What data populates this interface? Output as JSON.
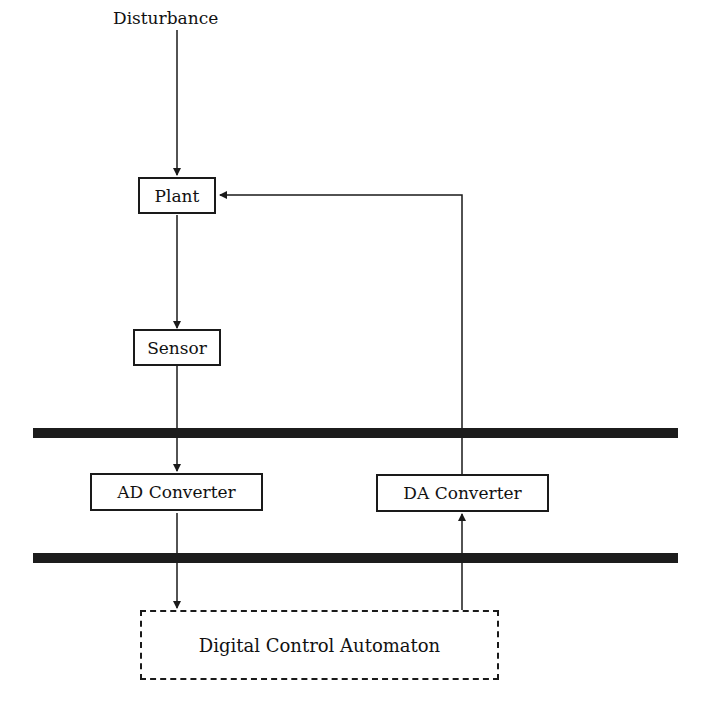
{
  "diagram": {
    "title": "",
    "nodes": {
      "disturbance": "Disturbance",
      "plant": "Plant",
      "sensor": "Sensor",
      "ad_converter": "AD Converter",
      "da_converter": "DA Converter",
      "automaton": "Digital Control Automaton"
    },
    "edges": [
      {
        "from": "Disturbance",
        "to": "Plant"
      },
      {
        "from": "Plant",
        "to": "Sensor"
      },
      {
        "from": "Sensor",
        "to": "AD Converter"
      },
      {
        "from": "AD Converter",
        "to": "Digital Control Automaton"
      },
      {
        "from": "Digital Control Automaton",
        "to": "DA Converter"
      },
      {
        "from": "DA Converter",
        "to": "Plant"
      }
    ],
    "boundaries": [
      "upper-interface-bar",
      "lower-interface-bar"
    ]
  }
}
